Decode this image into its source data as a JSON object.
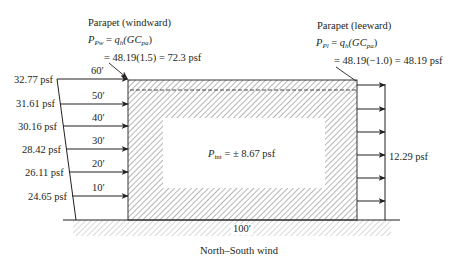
{
  "caption": "North–South wind",
  "building": {
    "width_label": "100′",
    "interior_pressure": {
      "symbol": "P",
      "subscript": "int",
      "value_text": " = ± 8.67 psf"
    }
  },
  "parapet_windward": {
    "title": "Parapet (windward)",
    "formula_symbol": "P",
    "formula_subscript": "Pw",
    "formula_rhs_q": "q",
    "formula_rhs_q_sub": "h",
    "formula_rhs_gc": "(GC",
    "formula_rhs_gc_sub": "pa",
    "formula_close": ")",
    "calc": "= 48.19(1.5) = 72.3 psf"
  },
  "parapet_leeward": {
    "title": "Parapet (leeward)",
    "formula_symbol": "P",
    "formula_subscript": "Pl",
    "formula_rhs_q": "q",
    "formula_rhs_q_sub": "h",
    "formula_rhs_gc": "(GC",
    "formula_rhs_gc_sub": "pa",
    "formula_close": ")",
    "calc": "= 48.19(−1.0) = 48.19 psf"
  },
  "windward_pressures": [
    {
      "height": "60′",
      "pressure": "32.77 psf"
    },
    {
      "height": "50′",
      "pressure": "31.61 psf"
    },
    {
      "height": "40′",
      "pressure": "30.16 psf"
    },
    {
      "height": "30′",
      "pressure": "28.42 psf"
    },
    {
      "height": "20′",
      "pressure": "26.11 psf"
    },
    {
      "height": "10′",
      "pressure": "24.65 psf"
    }
  ],
  "leeward_pressure": "12.29 psf",
  "colors": {
    "line": "#231f20",
    "hatch": "#6d6e71",
    "ground_hatch": "#a7a9ac"
  }
}
